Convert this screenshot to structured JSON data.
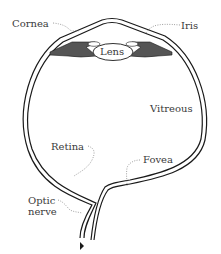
{
  "diagram": {
    "type": "anatomical-cross-section",
    "colors": {
      "line": "#1a1a1a",
      "iris_fill": "#555555",
      "label_text": "#3a3a3a",
      "background": "#ffffff"
    },
    "labels": {
      "cornea": "Cornea",
      "iris": "Iris",
      "lens": "Lens",
      "vitreous": "Vitreous",
      "retina": "Retina",
      "fovea": "Fovea",
      "optic_nerve_line1": "Optic",
      "optic_nerve_line2": "nerve"
    }
  }
}
